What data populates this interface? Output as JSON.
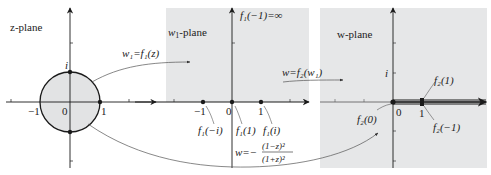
{
  "z_plane": {
    "title": "z-plane",
    "labels": {
      "i": "i",
      "neg_one": "−1",
      "zero": "0",
      "one": "1"
    }
  },
  "w1_plane": {
    "title_var": "w",
    "title_sub": "1",
    "title_rest": "-plane",
    "infinity_label": "f₁(−1)=∞",
    "labels": {
      "neg_one": "−1",
      "zero": "0",
      "one": "1"
    },
    "point_labels": {
      "f1_neg_i": "f₁(−i)",
      "f1_one": "f₁(1)",
      "f1_i": "f₁(i)"
    }
  },
  "w_plane": {
    "title": "w-plane",
    "labels": {
      "i": "i",
      "zero": "0",
      "one": "1"
    },
    "point_labels": {
      "f2_one": "f₂(1)",
      "f2_neg_one": "f₂(−1)",
      "f2_zero": "f₂(0)"
    }
  },
  "maps": {
    "map1": "w₁=f₁(z)",
    "map2": "w=f₂(w₁)",
    "composite_lhs": "w=−",
    "composite_num": "(1−z)²",
    "composite_den": "(1+z)²"
  },
  "colors": {
    "plane_fill": "#e6e7e8",
    "disk_fill": "#e2e3e4",
    "ink": "#1a1a1a",
    "curve": "#555555"
  }
}
